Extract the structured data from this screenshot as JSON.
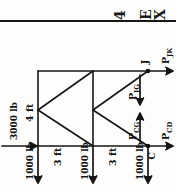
{
  "page": {
    "orientation": "rotated-90-ccw",
    "top_fragments": [
      {
        "text": "4",
        "x": 108,
        "y": 18
      },
      {
        "text": "E",
        "x": 134,
        "y": 18
      },
      {
        "text": "X",
        "x": 146,
        "y": 18
      }
    ],
    "ink_color": "#161616",
    "paper_color": "#fdfdfb"
  },
  "diagram": {
    "type": "truss-free-body-diagram",
    "applied_loads": {
      "horizontal": {
        "magnitude": "3000 lb",
        "direction": "right",
        "applied_at": "left-bottom-joint"
      },
      "vertical": [
        {
          "magnitude": "1000 lb",
          "direction": "down",
          "station": 1
        },
        {
          "magnitude": "1000 lb",
          "direction": "down",
          "station": 2
        },
        {
          "magnitude": "1000 lb",
          "direction": "down",
          "station": 3
        }
      ]
    },
    "dimensions": [
      {
        "label": "4 ft",
        "kind": "vertical-height"
      },
      {
        "label": "3 ft",
        "kind": "horizontal-bay",
        "bay": 1
      },
      {
        "label": "3 ft",
        "kind": "horizontal-bay",
        "bay": 2
      }
    ],
    "joints": [
      {
        "name": "J",
        "position": "top-right"
      },
      {
        "name": "C",
        "position": "bottom-right"
      }
    ],
    "member_forces": [
      {
        "label_main": "P",
        "label_sub": "JK",
        "display": "P_JK",
        "direction": "right-horizontal"
      },
      {
        "label_main": "P",
        "label_sub": "JG",
        "display": "P_JG",
        "direction": "down-diagonal"
      },
      {
        "label_main": "P",
        "label_sub": "CG",
        "display": "P_CG",
        "direction": "up-vertical"
      },
      {
        "label_main": "P",
        "label_sub": "CD",
        "display": "P_CD",
        "direction": "right-horizontal"
      }
    ]
  }
}
